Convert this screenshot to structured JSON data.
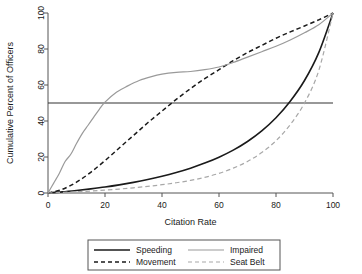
{
  "chart_data": {
    "type": "line",
    "title": "",
    "xlabel": "Citation Rate",
    "ylabel": "Cumulative Percent of Officers",
    "xlim": [
      0,
      100
    ],
    "ylim": [
      0,
      100
    ],
    "xticks": [
      0,
      20,
      40,
      60,
      80,
      100
    ],
    "yticks": [
      0,
      20,
      40,
      60,
      80,
      100
    ],
    "grid": false,
    "legend_position": "bottom",
    "reference_lines": [
      {
        "orientation": "horizontal",
        "value": 50,
        "style": "solid",
        "color": "#333333"
      }
    ],
    "series": [
      {
        "name": "Speeding",
        "style": "solid",
        "color": "#1a1a1a",
        "width": 1.6,
        "x": [
          0,
          5,
          10,
          15,
          20,
          25,
          30,
          35,
          40,
          45,
          50,
          55,
          60,
          65,
          70,
          75,
          80,
          85,
          90,
          95,
          100
        ],
        "y": [
          0,
          0.6,
          1.4,
          2.3,
          3.3,
          4.5,
          5.9,
          7.5,
          9.3,
          11.4,
          13.8,
          16.6,
          19.9,
          23.8,
          28.6,
          34.5,
          41.8,
          51.0,
          62.5,
          78.0,
          100
        ]
      },
      {
        "name": "Movement",
        "style": "dashed",
        "color": "#1a1a1a",
        "width": 1.5,
        "x": [
          0,
          5,
          10,
          15,
          20,
          25,
          30,
          35,
          40,
          45,
          50,
          55,
          60,
          65,
          70,
          75,
          80,
          85,
          90,
          95,
          100
        ],
        "y": [
          0,
          2.0,
          6.0,
          11.5,
          18.0,
          25.0,
          32.0,
          39.0,
          45.5,
          52.0,
          58.0,
          63.5,
          68.5,
          73.5,
          78.0,
          82.0,
          86.0,
          89.5,
          92.8,
          96.2,
          100
        ]
      },
      {
        "name": "Impaired",
        "style": "solid",
        "color": "#9a9a9a",
        "width": 1.2,
        "x": [
          0,
          2,
          4,
          6,
          8,
          10,
          12,
          14,
          16,
          18,
          20,
          24,
          28,
          32,
          36,
          40,
          45,
          50,
          55,
          60,
          65,
          70,
          75,
          80,
          85,
          90,
          95,
          100
        ],
        "y": [
          0,
          5.5,
          11.0,
          17.5,
          21.5,
          27.5,
          33.0,
          37.5,
          42.0,
          46.5,
          50.5,
          56.0,
          59.5,
          62.5,
          64.5,
          66.0,
          67.0,
          67.5,
          68.5,
          70.0,
          72.5,
          75.5,
          78.5,
          81.5,
          85.0,
          89.0,
          93.5,
          100
        ]
      },
      {
        "name": "Seat Belt",
        "style": "dashed",
        "color": "#a8a8a8",
        "width": 1.2,
        "x": [
          0,
          5,
          10,
          15,
          20,
          25,
          30,
          35,
          40,
          45,
          50,
          55,
          60,
          65,
          70,
          75,
          80,
          85,
          90,
          95,
          100
        ],
        "y": [
          0,
          0.3,
          0.7,
          1.1,
          1.6,
          2.2,
          2.9,
          3.7,
          4.6,
          5.7,
          7.0,
          8.7,
          10.9,
          13.8,
          17.5,
          22.5,
          29.0,
          38.0,
          50.0,
          68.0,
          100
        ]
      }
    ],
    "legend": [
      {
        "label": "Speeding",
        "style": "solid",
        "color": "#1a1a1a"
      },
      {
        "label": "Movement",
        "style": "dashed",
        "color": "#1a1a1a"
      },
      {
        "label": "Impaired",
        "style": "solid",
        "color": "#9a9a9a"
      },
      {
        "label": "Seat Belt",
        "style": "dashed",
        "color": "#a8a8a8"
      }
    ]
  }
}
